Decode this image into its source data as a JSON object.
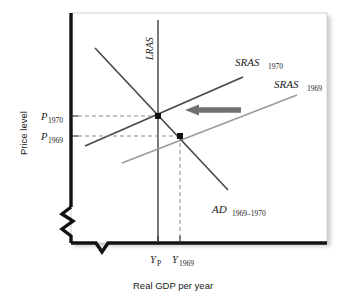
{
  "figure": {
    "kind": "ad-as-diagram",
    "axes": {
      "y_title": "Price level",
      "x_title": "Real GDP per year",
      "y_ticks": [
        {
          "base": "P",
          "sub": "1970",
          "value_y": 116
        },
        {
          "base": "P",
          "sub": "1969",
          "value_y": 136
        }
      ],
      "x_ticks": [
        {
          "base": "Y",
          "sub": "P",
          "value_x": 158
        },
        {
          "base": "Y",
          "sub": "1969",
          "value_x": 180
        }
      ],
      "break_marks": 2
    },
    "curves": [
      {
        "id": "lras",
        "base": "LRAS",
        "sub": "",
        "orientation": "vertical",
        "color": "#4d4d4d"
      },
      {
        "id": "sras1970",
        "base": "SRAS",
        "sub": "1970",
        "color": "#4d4d4d"
      },
      {
        "id": "sras1969",
        "base": "SRAS",
        "sub": "1969",
        "color": "#999999"
      },
      {
        "id": "ad",
        "base": "AD",
        "sub": "1969–1970",
        "color": "#4d4d4d"
      }
    ],
    "annotations": {
      "shift_arrow": {
        "name": "leftward-shift-arrow",
        "direction": "left",
        "color": "#707070"
      },
      "equilibrium_points": [
        {
          "name": "equilibrium-1970",
          "x": 158,
          "y": 116
        },
        {
          "name": "equilibrium-1969",
          "x": 180,
          "y": 136
        }
      ]
    },
    "colors": {
      "axis": "#111111",
      "plot_background": "#ffffff",
      "dashed_guide": "#8a8a8a",
      "arrow": "#707070"
    }
  }
}
